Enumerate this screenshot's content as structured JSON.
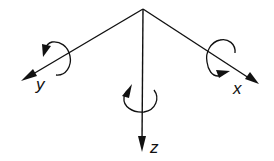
{
  "diagram": {
    "title": "",
    "origin": {
      "x": 143,
      "y": 9
    },
    "axes": [
      {
        "name": "x",
        "label": "x",
        "tip": {
          "x": 259,
          "y": 84
        },
        "rotation_direction": "clockwise-around-axis"
      },
      {
        "name": "y",
        "label": "y",
        "tip": {
          "x": 21,
          "y": 81
        },
        "rotation_direction": "counterclockwise-around-axis"
      },
      {
        "name": "z",
        "label": "z",
        "tip": {
          "x": 142,
          "y": 152
        },
        "rotation_direction": "counterclockwise-around-axis"
      }
    ],
    "colors": {
      "stroke": "#111111",
      "background": "#ffffff"
    }
  }
}
